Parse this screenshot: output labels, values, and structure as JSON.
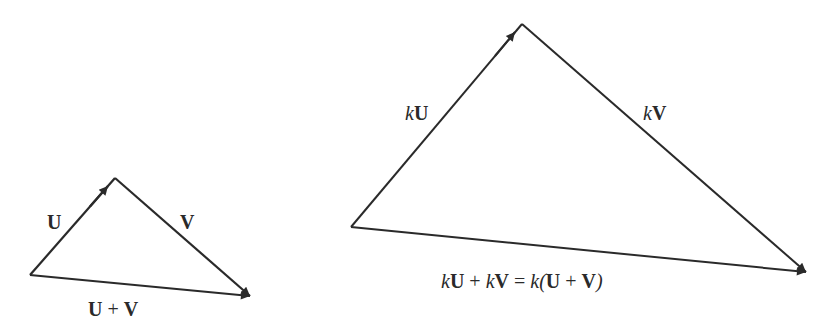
{
  "colors": {
    "stroke": "#2a2a2a",
    "background": "#ffffff"
  },
  "small_triangle": {
    "labels": {
      "u": "U",
      "v": "V",
      "sum_u": "U",
      "sum_plus": "+",
      "sum_v": "V"
    }
  },
  "large_triangle": {
    "labels": {
      "ku_k": "k",
      "ku_u": "U",
      "kv_k": "k",
      "kv_v": "V",
      "eq_k1": "k",
      "eq_u1": "U",
      "eq_plus1": "+",
      "eq_k2": "k",
      "eq_v1": "V",
      "eq_equals": "=",
      "eq_k3": "k(",
      "eq_u2": "U",
      "eq_plus2": "+",
      "eq_v2": "V",
      "eq_close": ")"
    }
  }
}
